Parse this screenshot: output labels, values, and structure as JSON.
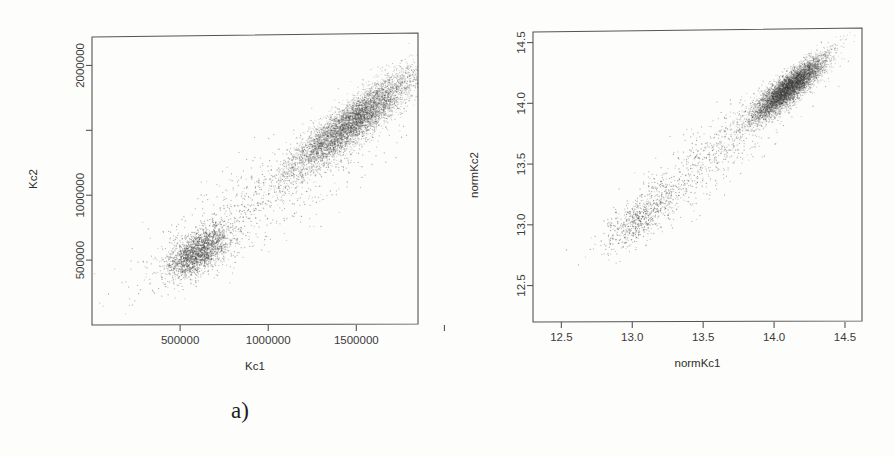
{
  "figure": {
    "panels": [
      {
        "id": "a",
        "caption": "a)",
        "xlabel": "Kc1",
        "ylabel": "Kc2",
        "x_ticks": [
          {
            "value": 500000,
            "label": "500000"
          },
          {
            "value": 1000000,
            "label": "1000000"
          },
          {
            "value": 1500000,
            "label": "1500000"
          },
          {
            "value": 2000000,
            "label": ""
          }
        ],
        "y_ticks": [
          {
            "value": 500000,
            "label": "500000"
          },
          {
            "value": 1000000,
            "label": "1000000"
          },
          {
            "value": 1500000,
            "label": ""
          },
          {
            "value": 2000000,
            "label": "2000000"
          }
        ]
      },
      {
        "id": "b",
        "caption": "b)",
        "xlabel": "normKc1",
        "ylabel": "normKc2",
        "x_ticks": [
          {
            "value": 12.5,
            "label": "12.5"
          },
          {
            "value": 13.0,
            "label": "13.0"
          },
          {
            "value": 13.5,
            "label": "13.5"
          },
          {
            "value": 14.0,
            "label": "14.0"
          },
          {
            "value": 14.5,
            "label": "14.5"
          }
        ],
        "y_ticks": [
          {
            "value": 12.5,
            "label": "12.5"
          },
          {
            "value": 13.0,
            "label": "13.0"
          },
          {
            "value": 13.5,
            "label": "13.5"
          },
          {
            "value": 14.0,
            "label": "14.0"
          },
          {
            "value": 14.5,
            "label": "14.5"
          }
        ]
      }
    ]
  },
  "chart_data": [
    {
      "type": "scatter",
      "panel": "a",
      "title": "a)",
      "xlabel": "Kc1",
      "ylabel": "Kc2",
      "xlim": [
        0,
        1850000
      ],
      "ylim": [
        0,
        2250000
      ],
      "grid": false,
      "legend": "none",
      "point_color": "#3d3d3d",
      "n_points": 9000,
      "clusters": [
        {
          "name": "high-expression cluster",
          "n": 6200,
          "x_mean": 1480000,
          "y_mean": 1560000,
          "x_sd": 180000,
          "y_sd": 200000,
          "correlation": 0.9,
          "density": "dense"
        },
        {
          "name": "low-expression cluster",
          "n": 2000,
          "x_mean": 600000,
          "y_mean": 560000,
          "x_sd": 90000,
          "y_sd": 95000,
          "correlation": 0.6,
          "density": "moderate"
        },
        {
          "name": "diagonal bridge scatter",
          "n": 800,
          "x_mean": 950000,
          "y_mean": 950000,
          "x_sd": 330000,
          "y_sd": 330000,
          "correlation": 0.85,
          "density": "sparse"
        }
      ]
    },
    {
      "type": "scatter",
      "panel": "b",
      "title": "b)",
      "xlabel": "normKc1",
      "ylabel": "normKc2",
      "xlim": [
        12.3,
        14.62
      ],
      "ylim": [
        12.2,
        14.62
      ],
      "grid": false,
      "legend": "none",
      "point_color": "#3d3d3d",
      "n_points": 9000,
      "clusters": [
        {
          "name": "high-expression cluster",
          "n": 6200,
          "x_mean": 14.1,
          "y_mean": 14.12,
          "x_sd": 0.13,
          "y_sd": 0.13,
          "correlation": 0.88,
          "density": "dense"
        },
        {
          "name": "low-expression tail",
          "n": 600,
          "x_mean": 13.05,
          "y_mean": 13.05,
          "x_sd": 0.13,
          "y_sd": 0.13,
          "correlation": 0.7,
          "density": "sparse"
        },
        {
          "name": "diagonal bridge scatter",
          "n": 700,
          "x_mean": 13.55,
          "y_mean": 13.55,
          "x_sd": 0.3,
          "y_sd": 0.3,
          "correlation": 0.88,
          "density": "sparse"
        }
      ]
    }
  ]
}
